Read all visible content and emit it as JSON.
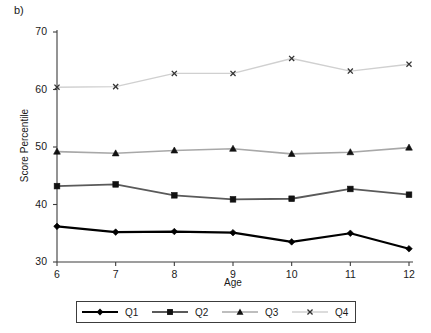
{
  "panel": {
    "label": "b)"
  },
  "chart_data": {
    "type": "line",
    "title": "",
    "xlabel": "Age",
    "ylabel": "Score Percentile",
    "categories": [
      6,
      7,
      8,
      9,
      10,
      11,
      12
    ],
    "x": [
      6,
      7,
      8,
      9,
      10,
      11,
      12
    ],
    "xlim": [
      6,
      12
    ],
    "ylim": [
      30,
      70
    ],
    "xticks": [
      "6",
      "7",
      "8",
      "9",
      "10",
      "11",
      "12"
    ],
    "yticks": [
      "30",
      "40",
      "50",
      "60",
      "70"
    ],
    "grid": false,
    "legend_position": "bottom",
    "series": [
      {
        "name": "Q1",
        "marker": "diamond",
        "color": "#000000",
        "line_color": "#000000",
        "line_width": 2.2,
        "values": [
          36.2,
          35.2,
          35.3,
          35.1,
          33.5,
          35.0,
          32.3
        ]
      },
      {
        "name": "Q2",
        "marker": "square",
        "color": "#111111",
        "line_color": "#5a5a5a",
        "line_width": 1.8,
        "values": [
          43.2,
          43.5,
          41.6,
          40.9,
          41.0,
          42.7,
          41.7
        ]
      },
      {
        "name": "Q3",
        "marker": "triangle",
        "color": "#111111",
        "line_color": "#a8a8a8",
        "line_width": 1.6,
        "values": [
          49.2,
          48.9,
          49.4,
          49.7,
          48.8,
          49.1,
          49.9
        ]
      },
      {
        "name": "Q4",
        "marker": "x",
        "color": "#333333",
        "line_color": "#d0d0d0",
        "line_width": 1.4,
        "values": [
          60.4,
          60.5,
          62.8,
          62.8,
          65.4,
          63.2,
          64.4
        ]
      }
    ]
  },
  "legend": {
    "entries": [
      {
        "label": "Q1"
      },
      {
        "label": "Q2"
      },
      {
        "label": "Q3"
      },
      {
        "label": "Q4"
      }
    ]
  },
  "axis_color": "#3c3c3c"
}
